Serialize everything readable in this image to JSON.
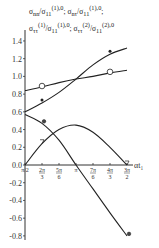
{
  "chart_data": {
    "type": "line",
    "title": "",
    "legend_lines": [
      "σ_nn/σ_11^(1),0 ; σ_nτ/σ_11^(1),0 ;",
      "σ_ττ^(1)/σ_11^(1),0 ; σ_ττ^(2)/σ_11^(2),0"
    ],
    "xlabel": "αt₁",
    "ylabel": "",
    "x_tick_labels": [
      "π/2",
      "2π/3",
      "5π/6",
      "π",
      "7π/6",
      "4π/3",
      "3π/2"
    ],
    "y_tick_labels": [
      "1.4",
      "1.2",
      "1.0",
      "0.8",
      "0.6",
      "0.4",
      "0.2",
      "0.0",
      "-0.2",
      "-0.4",
      "-0.6",
      "-0.8"
    ],
    "ylim": [
      -0.8,
      1.4
    ],
    "grid": false,
    "x": [
      1.5708,
      2.0944,
      2.618,
      3.1416,
      3.6652,
      4.1888,
      4.7124
    ],
    "series": [
      {
        "name": "open-circle",
        "marker": "circle-open",
        "values": [
          0.84,
          0.88,
          0.93,
          0.97,
          1.0,
          1.04,
          1.07
        ]
      },
      {
        "name": "asterisk",
        "marker": "asterisk",
        "values": [
          0.6,
          0.7,
          0.82,
          0.97,
          1.13,
          1.25,
          1.32
        ]
      },
      {
        "name": "filled-dot",
        "marker": "dot",
        "values": [
          0.57,
          0.47,
          0.28,
          0.0,
          -0.27,
          -0.54,
          -0.8
        ]
      },
      {
        "name": "triangle",
        "marker": "triangle",
        "values": [
          0.0,
          0.24,
          0.4,
          0.45,
          0.37,
          0.2,
          0.0
        ]
      }
    ]
  }
}
